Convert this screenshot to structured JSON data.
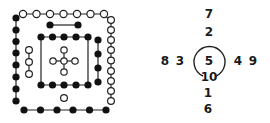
{
  "diagram": {
    "dot_diagram": {
      "colors": {
        "black_dot": "#111111",
        "white_dot": "#ffffff",
        "line": "#222222"
      },
      "groups": [
        {
          "name": "top-white-row",
          "type": "white",
          "count": 7
        },
        {
          "name": "left-black-column",
          "type": "black",
          "count": 8
        },
        {
          "name": "bottom-black-row",
          "type": "black",
          "count": 6
        },
        {
          "name": "right-white-column",
          "type": "white",
          "count": 9
        },
        {
          "name": "top-black-pair",
          "type": "black",
          "count": 2
        },
        {
          "name": "inner-top-black-row",
          "type": "black",
          "count": 5
        },
        {
          "name": "inner-bottom-black-row",
          "type": "black",
          "count": 5
        },
        {
          "name": "right-inner-black-column",
          "type": "black",
          "count": 4
        },
        {
          "name": "left-inner-white-column",
          "type": "white",
          "count": 3
        },
        {
          "name": "center-white-cross",
          "type": "white",
          "count": 5
        },
        {
          "name": "bottom-single-white",
          "type": "white",
          "count": 1
        }
      ]
    },
    "number_diagram": {
      "numbers": {
        "top_outer": "7",
        "top_inner": "2",
        "left_outer": "8",
        "left_inner": "3",
        "center": "5",
        "right_inner": "4",
        "right_outer": "9",
        "center_bottom": "10",
        "bottom_inner": "1",
        "bottom_outer": "6"
      }
    }
  }
}
